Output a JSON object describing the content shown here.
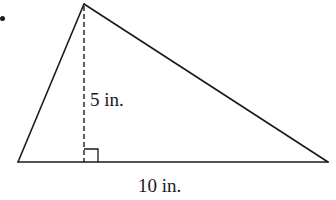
{
  "figure": {
    "type": "triangle",
    "colors": {
      "stroke": "#1a1a1a",
      "background": "#ffffff"
    },
    "vertices": {
      "apex": [
        84,
        4
      ],
      "left": [
        18,
        162
      ],
      "right": [
        328,
        162
      ]
    },
    "height": {
      "label": "5 in.",
      "style": "dashed",
      "foot": [
        84,
        162
      ]
    },
    "base": {
      "label": "10 in."
    },
    "right_angle_marker": true
  }
}
